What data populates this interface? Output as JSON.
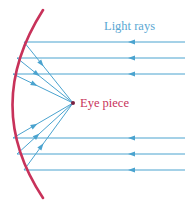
{
  "diagram": {
    "labels": {
      "light_rays": "Light rays",
      "eye_piece": "Eye piece"
    },
    "colors": {
      "mirror": "#c8325a",
      "rays": "#4aa3cf",
      "light_label": "#5aa7d3",
      "eye_label": "#c8325a",
      "focus_dot": "#7a2040"
    },
    "focus_point": {
      "x": 73,
      "y": 103
    },
    "rays": [
      {
        "y": 42,
        "mirror_x": 24
      },
      {
        "y": 58,
        "mirror_x": 17
      },
      {
        "y": 74,
        "mirror_x": 13
      },
      {
        "y": 138,
        "mirror_x": 13
      },
      {
        "y": 154,
        "mirror_x": 17
      },
      {
        "y": 170,
        "mirror_x": 24
      }
    ],
    "ray_start_x": 185,
    "arrow_x": 133
  }
}
